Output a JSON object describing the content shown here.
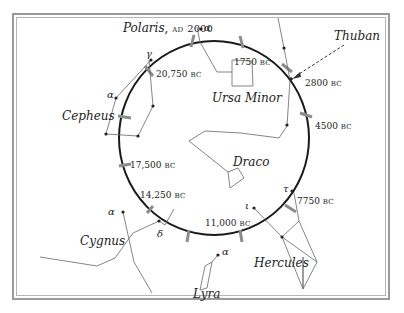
{
  "pole_star": {
    "name": "Polaris",
    "epoch": "AD 2000",
    "era": "AD",
    "year": "2000"
  },
  "callout": {
    "label": "Thuban"
  },
  "constellations": [
    {
      "name": "Cepheus"
    },
    {
      "name": "Ursa Minor"
    },
    {
      "name": "Draco"
    },
    {
      "name": "Cygnus"
    },
    {
      "name": "Lyra"
    },
    {
      "name": "Hercules"
    }
  ],
  "dates": [
    {
      "year": "1750",
      "era": "BC"
    },
    {
      "year": "2800",
      "era": "BC"
    },
    {
      "year": "4500",
      "era": "BC"
    },
    {
      "year": "7750",
      "era": "BC"
    },
    {
      "year": "11,000",
      "era": "BC"
    },
    {
      "year": "14,250",
      "era": "BC"
    },
    {
      "year": "17,500",
      "era": "BC"
    },
    {
      "year": "20,750",
      "era": "BC"
    }
  ],
  "star_labels": {
    "polaris_alpha": "α",
    "cepheus_gamma": "γ",
    "cepheus_alpha": "α",
    "cygnus_alpha": "α",
    "cygnus_delta": "δ",
    "lyra_alpha": "α",
    "hercules_tau": "τ",
    "hercules_iota": "ι"
  },
  "colors": {
    "circle": "#1a1a1a",
    "tick": "#8c8c8c",
    "lines": "#555555",
    "frame": "#9a9a9a"
  }
}
